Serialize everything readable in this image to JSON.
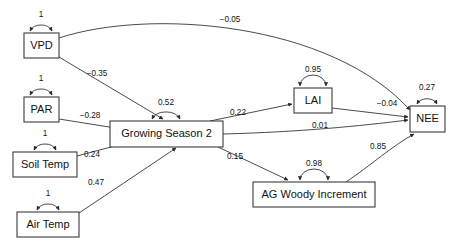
{
  "diagram": {
    "type": "path-analysis-sem",
    "title": "",
    "nodes": [
      {
        "id": "vpd",
        "label": "VPD",
        "x": 24,
        "y": 33,
        "w": 35,
        "h": 25
      },
      {
        "id": "par",
        "label": "PAR",
        "x": 24,
        "y": 97,
        "w": 35,
        "h": 25
      },
      {
        "id": "soil",
        "label": "Soil Temp",
        "x": 13,
        "y": 152,
        "w": 64,
        "h": 25
      },
      {
        "id": "air",
        "label": "Air Temp",
        "x": 17,
        "y": 212,
        "w": 62,
        "h": 25
      },
      {
        "id": "gs2",
        "label": "Growing Season 2",
        "x": 110,
        "y": 121,
        "w": 113,
        "h": 26
      },
      {
        "id": "lai",
        "label": "LAI",
        "x": 294,
        "y": 88,
        "w": 38,
        "h": 25
      },
      {
        "id": "agwi",
        "label": "AG Woody Increment",
        "x": 253,
        "y": 182,
        "w": 122,
        "h": 25
      },
      {
        "id": "nee",
        "label": "NEE",
        "x": 410,
        "y": 106,
        "w": 35,
        "h": 26
      }
    ],
    "self_loops": [
      {
        "node": "vpd",
        "label": "1",
        "lx": 41,
        "ly": 16
      },
      {
        "node": "par",
        "label": "1",
        "lx": 41,
        "ly": 80
      },
      {
        "node": "soil",
        "label": "1",
        "lx": 45,
        "ly": 135
      },
      {
        "node": "air",
        "label": "1",
        "lx": 48,
        "ly": 195
      },
      {
        "node": "gs2",
        "label": "0.52",
        "lx": 166,
        "ly": 104
      },
      {
        "node": "lai",
        "label": "0.95",
        "lx": 313,
        "ly": 71
      },
      {
        "node": "agwi",
        "label": "0.98",
        "lx": 314,
        "ly": 166
      },
      {
        "node": "nee",
        "label": "0.27",
        "lx": 427,
        "ly": 89
      }
    ],
    "edges": [
      {
        "id": "vpd-nee",
        "from": "VPD",
        "to": "NEE",
        "label": "−0.05",
        "lx": 230,
        "ly": 20
      },
      {
        "id": "vpd-gs2",
        "from": "VPD",
        "to": "Growing Season 2",
        "label": "−0.35",
        "lx": 97,
        "ly": 74
      },
      {
        "id": "par-gs2",
        "from": "PAR",
        "to": "Growing Season 2",
        "label": "−0.28",
        "lx": 90,
        "ly": 116
      },
      {
        "id": "soil-gs2",
        "from": "Soil Temp",
        "to": "Growing Season 2",
        "label": "0.24",
        "lx": 92,
        "ly": 155
      },
      {
        "id": "air-gs2",
        "from": "Air Temp",
        "to": "Growing Season 2",
        "label": "0.47",
        "lx": 96,
        "ly": 183
      },
      {
        "id": "gs2-lai",
        "from": "Growing Season 2",
        "to": "LAI",
        "label": "0.22",
        "lx": 238,
        "ly": 113
      },
      {
        "id": "gs2-nee",
        "from": "Growing Season 2",
        "to": "NEE",
        "label": "0.01",
        "lx": 320,
        "ly": 126
      },
      {
        "id": "gs2-agwi",
        "from": "Growing Season 2",
        "to": "AG Woody Increment",
        "label": "0.15",
        "lx": 235,
        "ly": 157
      },
      {
        "id": "lai-nee",
        "from": "LAI",
        "to": "NEE",
        "label": "−0.04",
        "lx": 387,
        "ly": 104
      },
      {
        "id": "agwi-nee",
        "from": "AG Woody Increment",
        "to": "NEE",
        "label": "0.85",
        "lx": 378,
        "ly": 147
      }
    ],
    "colors": {
      "node_stroke": "#3b3b3b",
      "node_fill": "#ffffff",
      "edge_stroke": "#2b2b2b",
      "text": "#111111",
      "background": "#ffffff"
    }
  }
}
